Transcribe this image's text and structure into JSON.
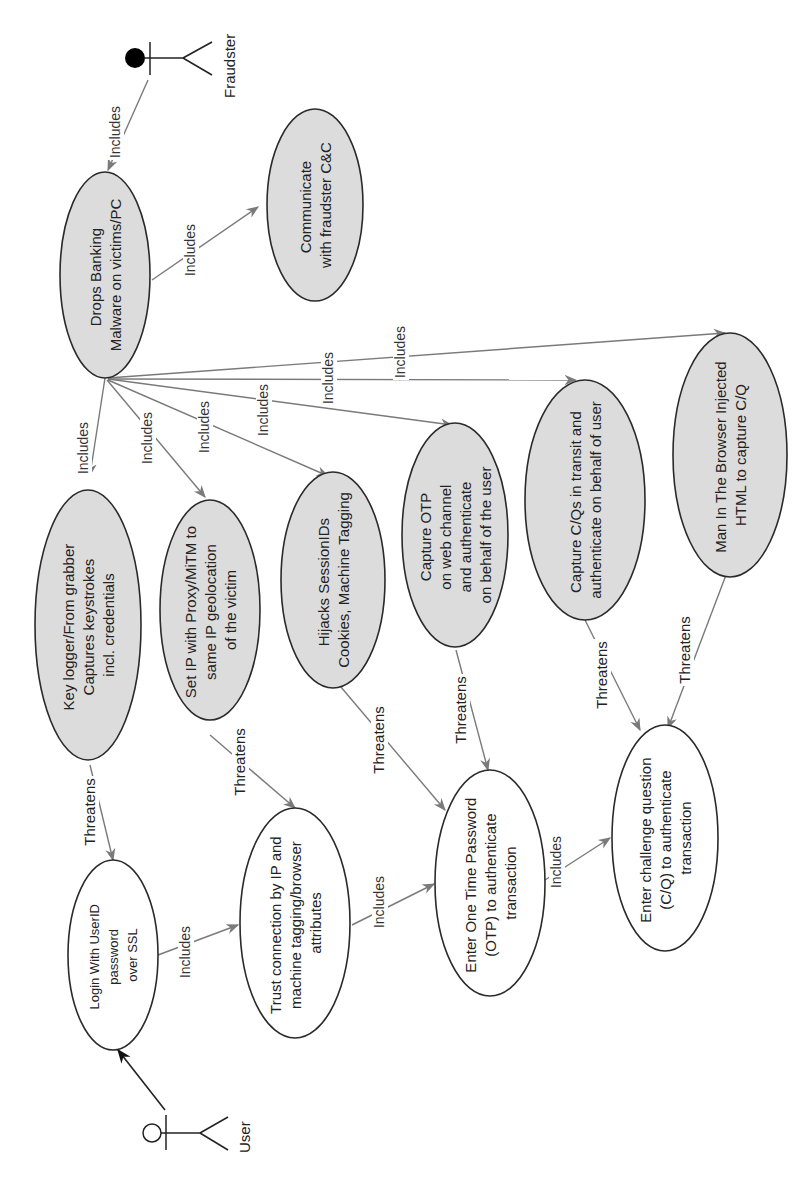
{
  "diagram": {
    "type": "use-case",
    "orientation": "rotated-90-ccw",
    "colors": {
      "threat_fill": "#dcdcdc",
      "normal_fill": "#ffffff",
      "outline": "#2a2a2a",
      "connector": "#7a7a7a"
    },
    "actors": {
      "fraudster": {
        "label": "Fraudster",
        "icon": "actor-filled-head-icon"
      },
      "user": {
        "label": "User",
        "icon": "actor-hollow-head-icon"
      }
    },
    "use_cases": {
      "drops_malware": {
        "lines": [
          "Drops Banking",
          "Malware on victims/PC"
        ],
        "kind": "threat"
      },
      "communicate_cc": {
        "lines": [
          "Communicate",
          "with fraudster C&C"
        ],
        "kind": "threat"
      },
      "key_logger": {
        "lines": [
          "Key logger/From grabber",
          "Captures keystrokes",
          "incl. credentials"
        ],
        "kind": "threat"
      },
      "set_ip_proxy": {
        "lines": [
          "Set IP with Proxy/MiTM to",
          "same IP geolocation",
          "of the victim"
        ],
        "kind": "threat"
      },
      "hijack_session": {
        "lines": [
          "Hijacks SessionIDs",
          "Cookies, Machine Tagging"
        ],
        "kind": "threat"
      },
      "capture_otp": {
        "lines": [
          "Capture OTP",
          "on web channel",
          "and authenticate",
          "on behalf of the user"
        ],
        "kind": "threat"
      },
      "capture_cq": {
        "lines": [
          "Capture C/Qs in transit and",
          "authenticate on behalf of user"
        ],
        "kind": "threat"
      },
      "mitb": {
        "lines": [
          "Man In The Browser Injected",
          "HTML to capture C/Q"
        ],
        "kind": "threat"
      },
      "login": {
        "lines": [
          "Login With UserID",
          "password",
          "over SSL"
        ],
        "kind": "normal"
      },
      "trust_connection": {
        "lines": [
          "Trust connection by IP and",
          "machine tagging/browser",
          "attributes"
        ],
        "kind": "normal"
      },
      "enter_otp": {
        "lines": [
          "Enter One Time Password",
          "(OTP) to authenticate",
          "transaction"
        ],
        "kind": "normal"
      },
      "enter_cq": {
        "lines": [
          "Enter challenge question",
          "(C/Q) to authenticate",
          "transaction"
        ],
        "kind": "normal"
      }
    },
    "edge_labels": {
      "includes": "Includes",
      "threatens": "Threatens"
    },
    "edges": [
      {
        "from": "fraudster",
        "to": "drops_malware",
        "label": "Includes"
      },
      {
        "from": "drops_malware",
        "to": "communicate_cc",
        "label": "Includes"
      },
      {
        "from": "drops_malware",
        "to": "key_logger",
        "label": "Includes"
      },
      {
        "from": "drops_malware",
        "to": "set_ip_proxy",
        "label": "Includes"
      },
      {
        "from": "drops_malware",
        "to": "hijack_session",
        "label": "Includes"
      },
      {
        "from": "drops_malware",
        "to": "capture_otp",
        "label": "Includes"
      },
      {
        "from": "drops_malware",
        "to": "capture_cq",
        "label": "Includes"
      },
      {
        "from": "drops_malware",
        "to": "mitb",
        "label": "Includes"
      },
      {
        "from": "key_logger",
        "to": "login",
        "label": "Threatens"
      },
      {
        "from": "set_ip_proxy",
        "to": "trust_connection",
        "label": "Threatens"
      },
      {
        "from": "hijack_session",
        "to": "enter_otp",
        "label": "Threatens"
      },
      {
        "from": "capture_otp",
        "to": "enter_otp",
        "label": "Threatens"
      },
      {
        "from": "capture_cq",
        "to": "enter_cq",
        "label": "Threatens"
      },
      {
        "from": "mitb",
        "to": "enter_cq",
        "label": "Threatens"
      },
      {
        "from": "user",
        "to": "login",
        "label": ""
      },
      {
        "from": "login",
        "to": "trust_connection",
        "label": "Includes"
      },
      {
        "from": "trust_connection",
        "to": "enter_otp",
        "label": "Includes"
      },
      {
        "from": "enter_otp",
        "to": "enter_cq",
        "label": "Includes"
      }
    ]
  }
}
